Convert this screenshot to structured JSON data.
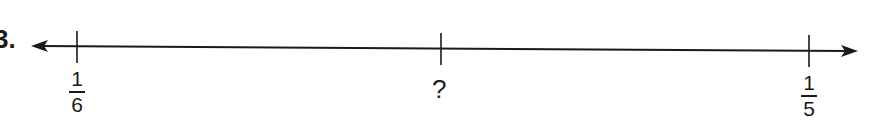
{
  "problem": {
    "number_suffix": "3."
  },
  "number_line": {
    "arrows": "both",
    "ticks": [
      {
        "x": 77,
        "label_type": "fraction",
        "numerator": "1",
        "denominator": "6"
      },
      {
        "x": 441,
        "label_type": "text",
        "text": "?"
      },
      {
        "x": 809,
        "label_type": "fraction",
        "numerator": "1",
        "denominator": "5"
      }
    ]
  }
}
